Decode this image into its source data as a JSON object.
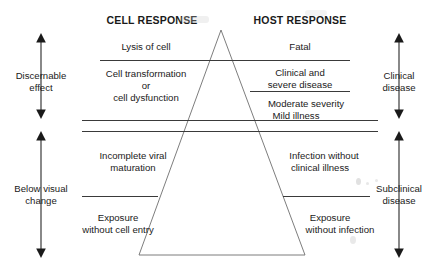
{
  "figure": {
    "type": "pyramid-diagram",
    "background_color": "#ffffff",
    "line_color": "#3a3a3a",
    "text_color": "#1a1a1a"
  },
  "headers": {
    "left": "CELL RESPONSE",
    "right": "HOST RESPONSE"
  },
  "cell_response": [
    {
      "label": "Lysis of cell"
    },
    {
      "label": "Cell transformation"
    },
    {
      "label": "or"
    },
    {
      "label": "cell dysfunction"
    },
    {
      "label": "Incomplete viral"
    },
    {
      "label": "maturation"
    },
    {
      "label": "Exposure"
    },
    {
      "label": "without cell entry"
    }
  ],
  "host_response": [
    {
      "label": "Fatal"
    },
    {
      "label": "Clinical and"
    },
    {
      "label": "severe disease"
    },
    {
      "label": "Moderate severity"
    },
    {
      "label": "Mild illness"
    },
    {
      "label": "Infection without"
    },
    {
      "label": "clinical illness"
    },
    {
      "label": "Exposure"
    },
    {
      "label": "without infection"
    }
  ],
  "left_axis": [
    {
      "line1": "Discernable",
      "line2": "effect",
      "arrow": "double-vertical-arrow"
    },
    {
      "line1": "Below visual",
      "line2": "change",
      "arrow": "double-vertical-arrow"
    }
  ],
  "right_axis": [
    {
      "line1": "Clinical",
      "line2": "disease",
      "arrow": "double-vertical-arrow"
    },
    {
      "line1": "Subclinical",
      "line2": "disease",
      "arrow": "double-vertical-arrow"
    }
  ]
}
